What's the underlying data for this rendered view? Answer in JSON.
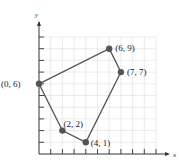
{
  "chart_data": {
    "type": "scatter",
    "title": "",
    "xlabel": "x",
    "ylabel": "y",
    "xlim": [
      0,
      10
    ],
    "ylim": [
      0,
      10
    ],
    "grid": true,
    "polygon_closed": true,
    "points": [
      {
        "x": 0,
        "y": 6,
        "label": "(0, 6)"
      },
      {
        "x": 6,
        "y": 9,
        "label": "(6, 9)"
      },
      {
        "x": 7,
        "y": 7,
        "label": "(7, 7)"
      },
      {
        "x": 4,
        "y": 1,
        "label": "(4, 1)"
      },
      {
        "x": 2,
        "y": 2,
        "label": "(2, 2)"
      }
    ],
    "colors": {
      "line": "#555555",
      "point": "#555555",
      "grid": "#dddddd",
      "axis": "#333333"
    }
  }
}
